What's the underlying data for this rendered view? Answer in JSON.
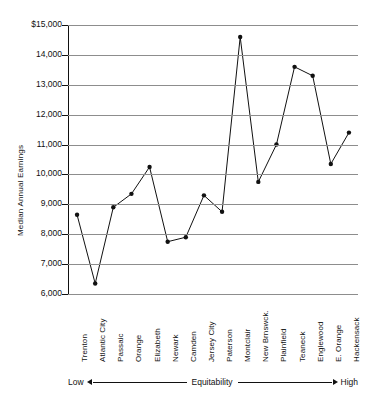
{
  "chart_data": {
    "type": "line",
    "title": "",
    "xlabel": "Equitability",
    "ylabel": "Median Annual Earnings",
    "ylim": [
      6000,
      15000
    ],
    "grid": true,
    "legend": "none",
    "categories": [
      "Trenton",
      "Atlantic City",
      "Passaic",
      "Orange",
      "Elizabeth",
      "Newark",
      "Camden",
      "Jersey City",
      "Paterson",
      "Montclair",
      "New Brnswck.",
      "Plainfield",
      "Teaneck",
      "Englewood",
      "E. Orange",
      "Hackensack"
    ],
    "values": [
      8650,
      6350,
      8900,
      9350,
      10250,
      7750,
      7900,
      9300,
      8750,
      14600,
      9750,
      11000,
      13600,
      13300,
      10350,
      11400
    ],
    "ytick_labels": [
      "$15,000",
      "14,000",
      "13,000",
      "12,000",
      "11,000",
      "10,000",
      "9,000",
      "8,000",
      "7,000",
      "6,000"
    ],
    "ytick_values": [
      15000,
      14000,
      13000,
      12000,
      11000,
      10000,
      9000,
      8000,
      7000,
      6000
    ],
    "axis_annotation": {
      "low": "Low",
      "middle": "Equitability",
      "high": "High"
    },
    "marker": "filled-circle",
    "line_color": "#111111",
    "grid_color": "#8d8d8d"
  }
}
